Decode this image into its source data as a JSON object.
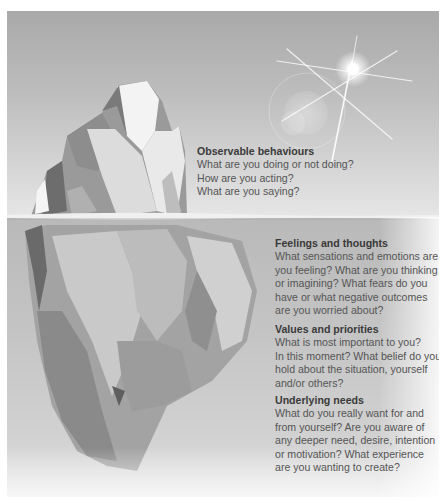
{
  "diagram": {
    "type": "iceberg-model",
    "sections": [
      {
        "id": "observable-behaviours",
        "zone": "above-water",
        "title": "Observable behaviours",
        "lines": [
          "What are you doing or not doing?",
          "How are you acting?",
          "What are you saying?"
        ]
      },
      {
        "id": "feelings-and-thoughts",
        "zone": "below-water",
        "title": "Feelings and thoughts",
        "lines": [
          "What sensations and emotions are",
          "you feeling? What are you thinking",
          "or imagining? What fears do you",
          "have or what negative outcomes",
          "are you worried about?"
        ]
      },
      {
        "id": "values-and-priorities",
        "zone": "below-water",
        "title": "Values and priorities",
        "lines": [
          "What is most important to you?",
          "In this moment? What belief do you",
          "hold about the situation, yourself",
          "and/or others?"
        ]
      },
      {
        "id": "underlying-needs",
        "zone": "below-water",
        "title": "Underlying needs",
        "lines": [
          "What do you really want for and",
          "from yourself? Are you aware of",
          "any deeper need, desire, intention",
          "or motivation? What experience",
          "are you wanting to create?"
        ]
      }
    ],
    "illustration": {
      "elements": [
        "iceberg-tip-icon",
        "iceberg-underwater-icon",
        "waterline",
        "sun-icon",
        "lens-flare"
      ]
    },
    "colors": {
      "sky_top": "#a9a9a9",
      "water": "#c4c4c4",
      "title_text": "#3a3a3a",
      "body_text": "#555555"
    }
  }
}
